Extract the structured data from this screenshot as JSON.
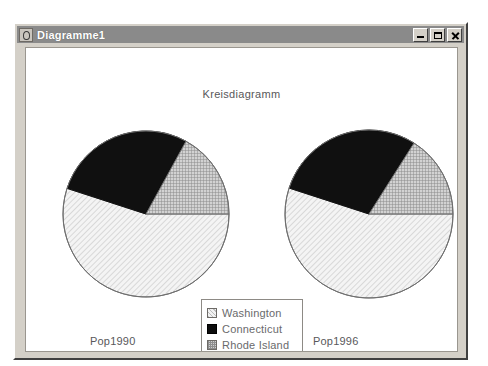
{
  "window": {
    "title": "Diagramme1",
    "icon": "chart-app-icon",
    "controls": [
      {
        "name": "minimize",
        "glyph": "_"
      },
      {
        "name": "maximize",
        "glyph": "□"
      },
      {
        "name": "close",
        "glyph": "×"
      }
    ]
  },
  "chart_title": "Kreisdiagramm",
  "labels": {
    "left": "Pop1990",
    "right": "Pop1996"
  },
  "legend": {
    "items": [
      {
        "label": "Washington",
        "swatch": "hatched-light",
        "color": "#f2f2f2"
      },
      {
        "label": "Connecticut",
        "swatch": "solid-black",
        "color": "#0d0d0d"
      },
      {
        "label": "Rhode Island",
        "swatch": "checked-gray",
        "color": "#cfcfcf"
      }
    ]
  },
  "chart_data": {
    "type": "pie",
    "title": "Kreisdiagramm",
    "categories": [
      "Washington",
      "Connecticut",
      "Rhode Island"
    ],
    "colors": [
      "#f2f2f2",
      "#0d0d0d",
      "#cfcfcf"
    ],
    "legend_position": "bottom-center",
    "charts": [
      {
        "name": "Pop1990",
        "label": "Pop1990",
        "center": [
          120,
          166
        ],
        "radius": 83,
        "values": [
          55,
          28,
          17
        ],
        "slices": [
          {
            "category": "Washington",
            "percent": 55
          },
          {
            "category": "Connecticut",
            "percent": 28
          },
          {
            "category": "Rhode Island",
            "percent": 17
          }
        ]
      },
      {
        "name": "Pop1996",
        "label": "Pop1996",
        "center": [
          343,
          166
        ],
        "radius": 84,
        "values": [
          55,
          29,
          16
        ],
        "slices": [
          {
            "category": "Washington",
            "percent": 55
          },
          {
            "category": "Connecticut",
            "percent": 29
          },
          {
            "category": "Rhode Island",
            "percent": 16
          }
        ]
      }
    ]
  }
}
